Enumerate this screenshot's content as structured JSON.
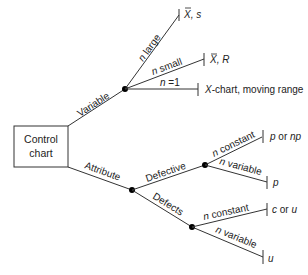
{
  "root": {
    "line1": "Control",
    "line2": "chart"
  },
  "branches": {
    "variable": "Variable",
    "attribute": "Attribute",
    "defective": "Defective",
    "defects": "Defects"
  },
  "variable_edges": {
    "large_n": "n",
    "large_rest": " large",
    "small_n": "n",
    "small_rest": " small",
    "one_n": "n",
    "one_rest": " =1"
  },
  "variable_outcomes": {
    "xbar_s_x": "X",
    "xbar_s_rest": ", s",
    "xbar_r_x": "X",
    "xbar_r_rest": ", R",
    "xchart_x": "X",
    "xchart_rest": "-chart, moving range"
  },
  "defective_edges": {
    "const_n": "n",
    "const_rest": " constant",
    "var_n": "n",
    "var_rest": " variable"
  },
  "defective_outcomes": {
    "p_or_np_a": "p",
    "p_or_np_mid": " or ",
    "p_or_np_b": "np",
    "p": "p"
  },
  "defects_edges": {
    "const_n": "n",
    "const_rest": " constant",
    "var_n": "n",
    "var_rest": " variable"
  },
  "defects_outcomes": {
    "c_or_u_a": "c",
    "c_or_u_mid": " or ",
    "c_or_u_b": "u",
    "u": "u"
  }
}
